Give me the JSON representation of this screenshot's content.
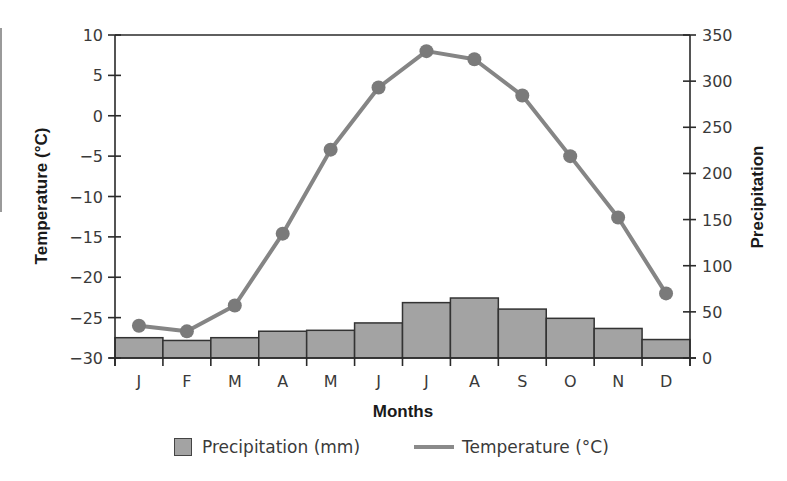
{
  "chart_data": {
    "type": "bar+line",
    "title": "",
    "categories": [
      "J",
      "F",
      "M",
      "A",
      "M",
      "J",
      "J",
      "A",
      "S",
      "O",
      "N",
      "D"
    ],
    "xlabel": "Months",
    "ylabel_left": "Temperature (°C)",
    "ylabel_right": "Precipitation",
    "ylim_left": [
      -30,
      10
    ],
    "ylim_right": [
      0,
      350
    ],
    "yticks_left": [
      10,
      5,
      0,
      -5,
      -10,
      -15,
      -20,
      -25,
      -30
    ],
    "yticks_right": [
      350,
      300,
      250,
      200,
      150,
      100,
      50,
      0
    ],
    "ytick_labels_left": [
      "10",
      "5",
      "0",
      "−5",
      "−10",
      "−15",
      "−20",
      "−25",
      "−30"
    ],
    "grid": false,
    "legend_position": "bottom",
    "series": [
      {
        "name": "Precipitation (mm)",
        "type": "bar",
        "axis": "right",
        "color": "#a3a3a3",
        "values": [
          22,
          19,
          22,
          29,
          30,
          38,
          60,
          65,
          53,
          43,
          32,
          20
        ]
      },
      {
        "name": "Temperature (°C)",
        "type": "line",
        "axis": "left",
        "color": "#858585",
        "marker_color": "#7a7a7a",
        "values": [
          -26,
          -26.7,
          -23.5,
          -14.6,
          -4.2,
          3.5,
          8,
          7,
          2.5,
          -5,
          -12.6,
          -22
        ]
      }
    ]
  },
  "legend": {
    "items": [
      {
        "label": "Precipitation (mm)",
        "icon": "filled-square-swatch"
      },
      {
        "label": "Temperature (°C)",
        "icon": "line-swatch"
      }
    ]
  }
}
